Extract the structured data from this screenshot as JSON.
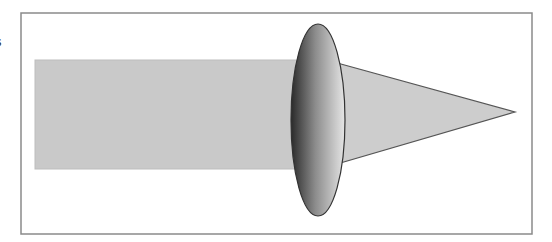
{
  "figure": {
    "edge_text": "s",
    "frame": {
      "x": 21,
      "y": 13,
      "width": 511,
      "height": 221,
      "stroke": "#8a8a8a"
    },
    "beam": {
      "x": 35,
      "y": 60,
      "width": 290,
      "height": 109,
      "fill": "#c9c9c9",
      "stroke": "#bdbdbd"
    },
    "cone": {
      "points": "330,61 515,112 330,166",
      "fill": "#cdcdcd",
      "stroke": "#555555"
    },
    "lens": {
      "cx": 318,
      "cy": 120,
      "rx": 27,
      "ry": 96,
      "dark": "#2a2a2a",
      "mid": "#8c8c8c",
      "light": "#e6e6e6",
      "stroke": "#333333"
    }
  }
}
